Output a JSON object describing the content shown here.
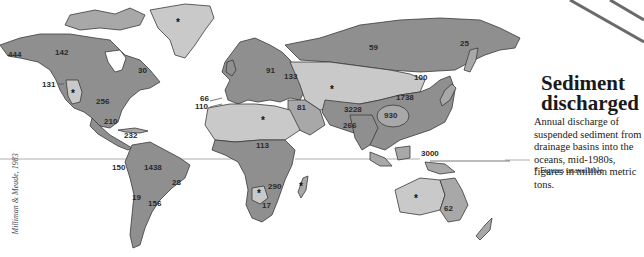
{
  "title": "Sediment discharged",
  "title_lines": [
    "Sediment",
    "discharged"
  ],
  "subtitle": "Annual discharge of suspended sediment from drainage basins into the oceans, mid-1980s, figures in million metric tons.",
  "note": "* Figures unavailable",
  "credit": "Milliman & Meade, 1983",
  "legend": {
    "unavailable_symbol": "*",
    "unit": "million metric tons"
  },
  "colors": {
    "land_dark": "#8f8f8f",
    "land_mid": "#a8a8a8",
    "land_light": "#c9c9c9",
    "outline": "#3a3a3a",
    "equator": "#9a9a9a",
    "text": "#1a1a1a"
  },
  "regions": [
    {
      "label": "444",
      "area": "Alaska"
    },
    {
      "label": "142",
      "area": "Northwest Canada"
    },
    {
      "label": "30",
      "area": "Eastern Canada"
    },
    {
      "label": "131",
      "area": "Pacific Northwest US"
    },
    {
      "label": "*",
      "area": "Great Basin US"
    },
    {
      "label": "256",
      "area": "Mississippi basin"
    },
    {
      "label": "210",
      "area": "Gulf of Mexico"
    },
    {
      "label": "232",
      "area": "Central America / Caribbean"
    },
    {
      "label": "*",
      "area": "Greenland"
    },
    {
      "label": "150",
      "area": "Pacific South America"
    },
    {
      "label": "1438",
      "area": "Amazon basin"
    },
    {
      "label": "28",
      "area": "Eastern Brazil"
    },
    {
      "label": "19",
      "area": "Chile"
    },
    {
      "label": "156",
      "area": "Parana basin"
    },
    {
      "label": "66",
      "area": "Iberia Atlantic"
    },
    {
      "label": "110",
      "area": "Northwest Africa"
    },
    {
      "label": "91",
      "area": "Central Europe"
    },
    {
      "label": "133",
      "area": "Black Sea basin"
    },
    {
      "label": "81",
      "area": "Middle East"
    },
    {
      "label": "*",
      "area": "Sahara"
    },
    {
      "label": "113",
      "area": "West Africa"
    },
    {
      "label": "290",
      "area": "Southeast Africa"
    },
    {
      "label": "*",
      "area": "Kalahari"
    },
    {
      "label": "17",
      "area": "Southern Africa"
    },
    {
      "label": "*",
      "area": "Madagascar"
    },
    {
      "label": "59",
      "area": "Siberia"
    },
    {
      "label": "25",
      "area": "Northeast Siberia"
    },
    {
      "label": "*",
      "area": "Central Asia"
    },
    {
      "label": "100",
      "area": "Amur basin"
    },
    {
      "label": "1738",
      "area": "Northern China"
    },
    {
      "label": "3228",
      "area": "South Asia"
    },
    {
      "label": "266",
      "area": "India"
    },
    {
      "label": "930",
      "area": "Southern China"
    },
    {
      "label": "3000",
      "area": "Indonesia / Oceania"
    },
    {
      "label": "*",
      "area": "Western Australia"
    },
    {
      "label": "62",
      "area": "Eastern Australia"
    }
  ]
}
